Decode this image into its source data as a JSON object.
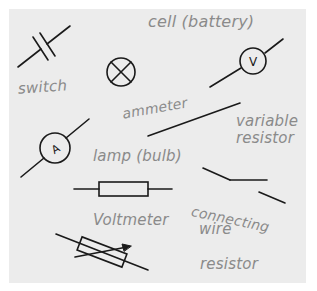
{
  "diagram": {
    "background": "#ececec",
    "ink_color": "#1a1a1a",
    "label_color": "#8a8a8a",
    "labels": {
      "cell": "cell (battery)",
      "switch": "switch",
      "ammeter": "ammeter",
      "variable_resistor_line1": "variable",
      "variable_resistor_line2": "resistor",
      "lamp": "lamp (bulb)",
      "voltmeter": "Voltmeter",
      "connecting_wire_line1": "connecting",
      "connecting_wire_line2": "wire",
      "resistor": "resistor"
    },
    "symbols": [
      {
        "name": "cell-symbol",
        "letter": ""
      },
      {
        "name": "lamp-symbol",
        "letter": ""
      },
      {
        "name": "voltmeter-symbol",
        "letter": "V"
      },
      {
        "name": "ammeter-symbol",
        "letter": "A"
      },
      {
        "name": "connecting-wire-symbol",
        "letter": ""
      },
      {
        "name": "resistor-symbol",
        "letter": ""
      },
      {
        "name": "variable-resistor-symbol",
        "letter": ""
      },
      {
        "name": "switch-symbol",
        "letter": ""
      }
    ]
  }
}
